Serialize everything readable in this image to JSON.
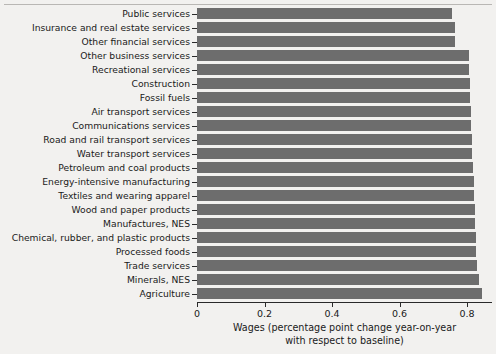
{
  "chart_data": {
    "type": "bar",
    "orientation": "horizontal",
    "title": "",
    "subtitle": "",
    "xlabel_line1": "Wages (percentage point change year-on-year",
    "xlabel_line2": "with respect to baseline)",
    "ylabel": "",
    "grid": false,
    "legend": null,
    "xlim": [
      0,
      0.875
    ],
    "xticks": [
      0,
      0.2,
      0.4,
      0.6,
      0.8
    ],
    "xtick_labels": [
      "0",
      "0.2",
      "0.4",
      "0.6",
      "0.8"
    ],
    "bar_color": "#6d6d6d",
    "background_color": "#f2f1ef",
    "categories": [
      "Public services",
      "Insurance and real estate services",
      "Other financial services",
      "Other business services",
      "Recreational services",
      "Construction",
      "Fossil fuels",
      "Air transport services",
      "Communications services",
      "Road and rail transport services",
      "Water transport services",
      "Petroleum and coal products",
      "Energy-intensive manufacturing",
      "Textiles and wearing apparel",
      "Wood and paper products",
      "Manufactures, NES",
      "Chemical, rubber, and plastic products",
      "Processed foods",
      "Trade services",
      "Minerals, NES",
      "Agriculture"
    ],
    "values": [
      0.755,
      0.764,
      0.764,
      0.806,
      0.806,
      0.808,
      0.808,
      0.813,
      0.813,
      0.816,
      0.816,
      0.819,
      0.822,
      0.822,
      0.825,
      0.825,
      0.828,
      0.828,
      0.831,
      0.837,
      0.843
    ]
  }
}
